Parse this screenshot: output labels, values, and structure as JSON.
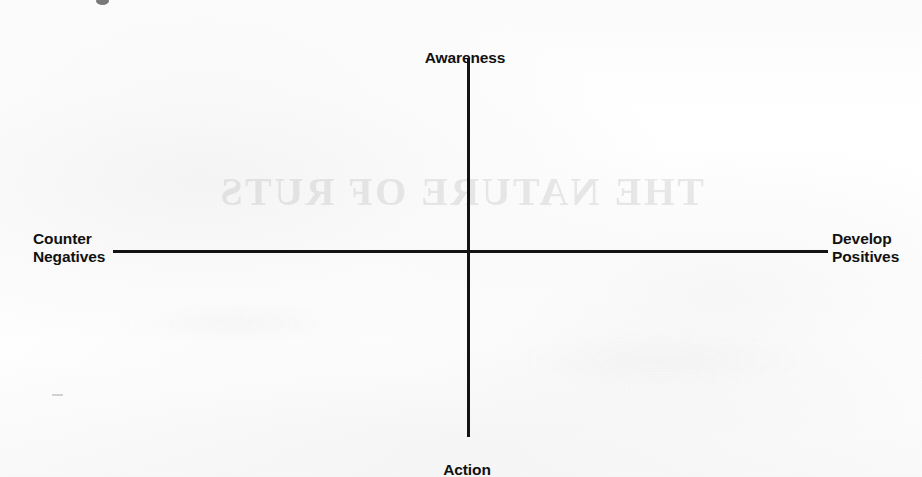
{
  "diagram": {
    "type": "quadrant-cross-axes",
    "axes": {
      "vertical": {
        "top_label": "Awareness",
        "bottom_label": "Action",
        "color": "#131313"
      },
      "horizontal": {
        "left_label": "Counter\nNegatives",
        "right_label": "Develop\nPositives",
        "color": "#131313"
      }
    },
    "background": {
      "bleed_through_text": "THE NATURE OF RUTS",
      "paper_color": "#fdfdfd"
    }
  }
}
